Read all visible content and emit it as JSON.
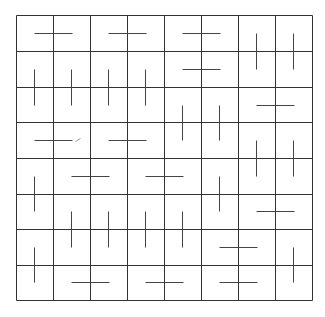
{
  "diagram": {
    "type": "grid-segment-puzzle",
    "grid": {
      "rows": 8,
      "cols": 8,
      "x_lines": [
        16,
        53,
        90,
        127,
        164,
        201,
        238,
        275,
        312
      ],
      "y_lines": [
        15,
        51,
        87,
        122,
        158,
        194,
        229,
        265,
        300
      ],
      "line_color": "#333333",
      "line_width": 1
    },
    "segment_color": "#444444",
    "segment_width": 1,
    "segments": [
      {
        "orientation": "h",
        "x1": 34,
        "y1": 33,
        "x2": 72,
        "y2": 33
      },
      {
        "orientation": "h",
        "x1": 108,
        "y1": 33,
        "x2": 146,
        "y2": 33
      },
      {
        "orientation": "h",
        "x1": 182,
        "y1": 33,
        "x2": 220,
        "y2": 33
      },
      {
        "orientation": "v",
        "x1": 256,
        "y1": 33,
        "x2": 256,
        "y2": 69
      },
      {
        "orientation": "v",
        "x1": 293,
        "y1": 33,
        "x2": 293,
        "y2": 69
      },
      {
        "orientation": "h",
        "x1": 182,
        "y1": 69,
        "x2": 220,
        "y2": 69
      },
      {
        "orientation": "v",
        "x1": 34,
        "y1": 69,
        "x2": 34,
        "y2": 105
      },
      {
        "orientation": "v",
        "x1": 71,
        "y1": 69,
        "x2": 71,
        "y2": 105
      },
      {
        "orientation": "v",
        "x1": 108,
        "y1": 69,
        "x2": 108,
        "y2": 105
      },
      {
        "orientation": "v",
        "x1": 145,
        "y1": 69,
        "x2": 145,
        "y2": 105
      },
      {
        "orientation": "h",
        "x1": 256,
        "y1": 105,
        "x2": 294,
        "y2": 105
      },
      {
        "orientation": "v",
        "x1": 182,
        "y1": 105,
        "x2": 182,
        "y2": 140
      },
      {
        "orientation": "v",
        "x1": 219,
        "y1": 105,
        "x2": 219,
        "y2": 140
      },
      {
        "orientation": "h",
        "x1": 34,
        "y1": 140,
        "x2": 72,
        "y2": 140
      },
      {
        "orientation": "h",
        "x1": 108,
        "y1": 140,
        "x2": 146,
        "y2": 140
      },
      {
        "orientation": "v",
        "x1": 256,
        "y1": 140,
        "x2": 256,
        "y2": 176
      },
      {
        "orientation": "v",
        "x1": 293,
        "y1": 140,
        "x2": 293,
        "y2": 176
      },
      {
        "orientation": "h",
        "x1": 71,
        "y1": 176,
        "x2": 109,
        "y2": 176
      },
      {
        "orientation": "h",
        "x1": 145,
        "y1": 176,
        "x2": 183,
        "y2": 176
      },
      {
        "orientation": "v",
        "x1": 34,
        "y1": 176,
        "x2": 34,
        "y2": 211
      },
      {
        "orientation": "v",
        "x1": 219,
        "y1": 176,
        "x2": 219,
        "y2": 211
      },
      {
        "orientation": "h",
        "x1": 256,
        "y1": 211,
        "x2": 294,
        "y2": 211
      },
      {
        "orientation": "v",
        "x1": 71,
        "y1": 211,
        "x2": 71,
        "y2": 247
      },
      {
        "orientation": "v",
        "x1": 108,
        "y1": 211,
        "x2": 108,
        "y2": 247
      },
      {
        "orientation": "v",
        "x1": 145,
        "y1": 211,
        "x2": 145,
        "y2": 247
      },
      {
        "orientation": "v",
        "x1": 182,
        "y1": 211,
        "x2": 182,
        "y2": 247
      },
      {
        "orientation": "h",
        "x1": 219,
        "y1": 247,
        "x2": 257,
        "y2": 247
      },
      {
        "orientation": "v",
        "x1": 34,
        "y1": 247,
        "x2": 34,
        "y2": 282
      },
      {
        "orientation": "v",
        "x1": 293,
        "y1": 247,
        "x2": 293,
        "y2": 282
      },
      {
        "orientation": "h",
        "x1": 71,
        "y1": 282,
        "x2": 109,
        "y2": 282
      },
      {
        "orientation": "h",
        "x1": 145,
        "y1": 282,
        "x2": 183,
        "y2": 282
      },
      {
        "orientation": "h",
        "x1": 219,
        "y1": 282,
        "x2": 257,
        "y2": 282
      }
    ],
    "marks": [
      {
        "type": "diagonal-tick",
        "x1": 75,
        "y1": 141,
        "x2": 80,
        "y2": 138,
        "color": "#999999"
      }
    ]
  }
}
